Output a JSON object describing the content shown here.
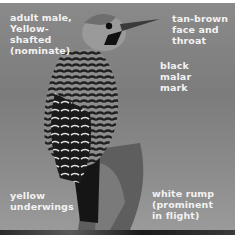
{
  "image": {
    "subject": "Northern Flicker woodpecker perched on a stump (grayscale photo)",
    "annotations": {
      "adult": "adult male,\nYellow-\nshafted\n(nominate)",
      "face": "tan-brown\nface and\nthroat",
      "malar": "black\nmalar\nmark",
      "underwings": "yellow\nunderwings",
      "rump": "white rump\n(prominent\nin flight)"
    }
  },
  "colors": {
    "background": "#848484",
    "label_text": "#f2f2f2"
  }
}
